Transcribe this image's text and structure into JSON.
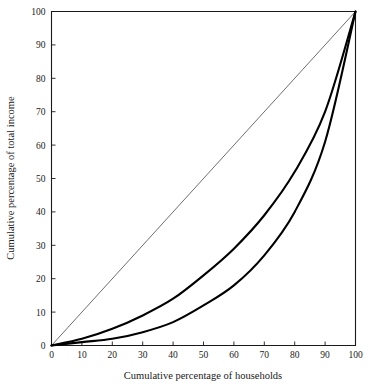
{
  "chart_data": {
    "type": "line",
    "title": "",
    "xlabel": "Cumulative percentage of households",
    "ylabel": "Cumulative percentage of total income",
    "xlim": [
      0,
      100
    ],
    "ylim": [
      0,
      100
    ],
    "grid": false,
    "legend": "none",
    "xticks": [
      0,
      10,
      20,
      30,
      40,
      50,
      60,
      70,
      80,
      90,
      100
    ],
    "yticks": [
      0,
      10,
      20,
      30,
      40,
      50,
      60,
      70,
      80,
      90,
      100
    ],
    "xtick_labels": [
      "0",
      "10",
      "20",
      "30",
      "40",
      "50",
      "60",
      "70",
      "80",
      "90",
      "100"
    ],
    "ytick_labels": [
      "0",
      "10",
      "20",
      "30",
      "40",
      "50",
      "60",
      "70",
      "80",
      "90",
      "100"
    ],
    "x": [
      0,
      10,
      20,
      30,
      40,
      50,
      60,
      70,
      80,
      90,
      100
    ],
    "series": [
      {
        "name": "line-of-equality",
        "style": "thin",
        "color": "#4a4a4a",
        "values": [
          0,
          10,
          20,
          30,
          40,
          50,
          60,
          70,
          80,
          90,
          100
        ]
      },
      {
        "name": "lorenz-curve-upper",
        "style": "thick",
        "color": "#000000",
        "values": [
          0,
          2,
          5,
          9,
          14,
          21,
          29,
          39,
          52,
          70,
          100
        ]
      },
      {
        "name": "lorenz-curve-lower",
        "style": "thick",
        "color": "#000000",
        "values": [
          0,
          1,
          2,
          4,
          7,
          12,
          18,
          27,
          40,
          61,
          100
        ]
      }
    ]
  },
  "axes": {
    "x_title": "Cumulative percentage of households",
    "y_title": "Cumulative percentage of total income"
  }
}
